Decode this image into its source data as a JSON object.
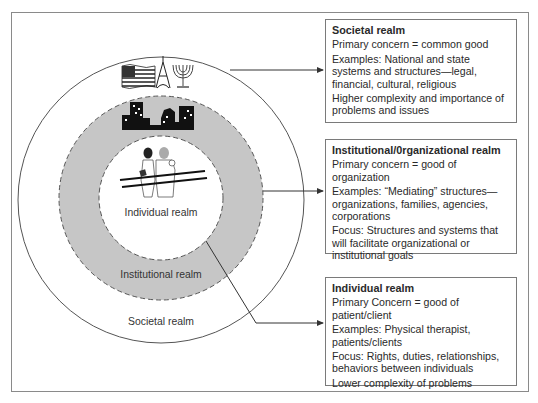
{
  "diagram": {
    "circles": {
      "outer_label": "Societal realm",
      "middle_label": "Institutional realm",
      "inner_label": "Individual realm"
    },
    "icons": {
      "societal": [
        "american-flag-icon",
        "eiffel-tower-icon",
        "menorah-icon"
      ],
      "institutional": [
        "city-skyline-icon"
      ],
      "individual": [
        "therapist-patient-parallel-bars-icon"
      ]
    },
    "colors": {
      "ring_fill": "#c6c6c6",
      "line": "#333333",
      "frame": "#8a8a8a"
    }
  },
  "boxes": {
    "societal": {
      "title": "Societal realm",
      "lines": [
        "Primary concern = common good",
        "Examples: National and state systems and structures—legal, financial, cultural, religious",
        "Higher complexity and importance of problems and issues"
      ]
    },
    "institutional": {
      "title": "Institutional/0rganizational realm",
      "lines": [
        "Primary concern = good of organization",
        "Examples: “Mediating” structures—organizations, families, agencies, corporations",
        "Focus: Structures and systems that will facilitate organizational or institutional goals"
      ]
    },
    "individual": {
      "title": "Individual realm",
      "lines": [
        "Primary Concern = good of patient/client",
        "Examples: Physical therapist, patients/clients",
        "Focus: Rights, duties, relationships, behaviors between individuals",
        "Lower complexity of problems"
      ]
    }
  }
}
